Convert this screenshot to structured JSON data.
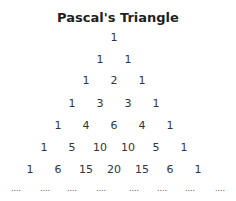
{
  "title": "Pascal's Triangle",
  "rows": [
    [
      "1"
    ],
    [
      "1",
      "1"
    ],
    [
      "1",
      "2",
      "1"
    ],
    [
      "1",
      "3",
      "3",
      "1"
    ],
    [
      "1",
      "4",
      "6",
      "4",
      "1"
    ],
    [
      "1",
      "5",
      "10",
      "10",
      "5",
      "1"
    ],
    [
      "1",
      "6",
      "15",
      "20",
      "15",
      "6",
      "1"
    ]
  ],
  "continuation": [
    "....",
    "....",
    "....",
    "....",
    "....",
    "....",
    "....",
    "...."
  ]
}
